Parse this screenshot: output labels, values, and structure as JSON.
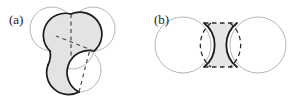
{
  "figure": {
    "width": 295,
    "height": 96,
    "background": "#ffffff",
    "panels": [
      {
        "id": "a",
        "label": "(a)",
        "description": "three-fold symmetric shaded triquetra region formed by four overlapping circles",
        "circle_outline_color": "#b6b6b6",
        "circle_fill_color": "#ffffff",
        "region_fill_color": "#e3e3e3",
        "region_outline_color": "#1b1b1b",
        "dashed_line_color": "#4a4a4a",
        "circles": [
          {
            "name": "center-circle",
            "cx": 72,
            "cy": 47,
            "r": 22
          },
          {
            "name": "upper-left-circle",
            "cx": 52,
            "cy": 29,
            "r": 22
          },
          {
            "name": "upper-right-circle",
            "cx": 93,
            "cy": 29,
            "r": 22
          },
          {
            "name": "lower-circle",
            "cx": 79,
            "cy": 70,
            "r": 22
          }
        ],
        "dashed_segments": 3
      },
      {
        "id": "b",
        "label": "(b)",
        "description": "shaded spool-shaped lens region between two overlapping circles with dashed boundary",
        "circle_outline_color": "#b6b6b6",
        "circle_fill_color": "#ffffff",
        "region_fill_color": "#e6e6e6",
        "region_outline_color": "#1b1b1b",
        "dashed_line_color": "#2b2b2b",
        "circles": [
          {
            "name": "left-circle",
            "cx": 35,
            "cy": 45,
            "r": 28
          },
          {
            "name": "right-circle",
            "cx": 110,
            "cy": 45,
            "r": 28
          }
        ],
        "dashed_segments": 4
      }
    ]
  }
}
